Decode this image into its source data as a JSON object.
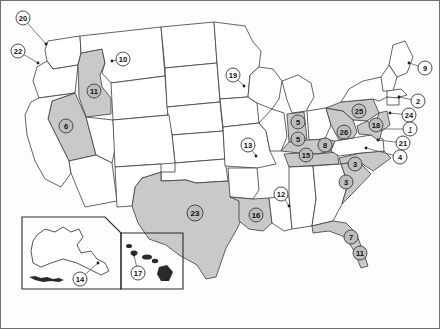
{
  "figure": {
    "type": "choropleth-point-map",
    "region": "United States",
    "background_color": "#fdfdfd",
    "border_color": "#6f6f6f",
    "shaded_state_color": "#c9c9c9",
    "plain_state_color": "#ffffff",
    "outline_color": "#3b3b3b",
    "marker_fill": "#ffffff",
    "marker_border": "#4a4a4a",
    "has_alaska_inset": true,
    "has_hawaii_inset": true
  },
  "insets": [
    {
      "name": "alaska-inset",
      "label": "14"
    },
    {
      "name": "hawaii-inset",
      "label": "17"
    }
  ],
  "markers": [
    {
      "id": "marker-20",
      "label": "20",
      "x": 22,
      "y": 17,
      "size": "m-sm",
      "on_shade": false,
      "italic": false,
      "leader": true,
      "dot_x": 45,
      "dot_y": 43
    },
    {
      "id": "marker-22",
      "label": "22",
      "x": 17,
      "y": 50,
      "size": "m-sm",
      "on_shade": false,
      "italic": false,
      "leader": true,
      "dot_x": 37,
      "dot_y": 62
    },
    {
      "id": "marker-10",
      "label": "10",
      "x": 122,
      "y": 58,
      "size": "m-sm",
      "on_shade": false,
      "italic": false,
      "leader": true,
      "dot_x": 111,
      "dot_y": 60
    },
    {
      "id": "marker-11-idaho",
      "label": "11",
      "x": 93,
      "y": 90,
      "size": "m-sm",
      "on_shade": true,
      "italic": false,
      "leader": false,
      "dot_x": 0,
      "dot_y": 0
    },
    {
      "id": "marker-6",
      "label": "6",
      "x": 65,
      "y": 125,
      "size": "m-sm",
      "on_shade": true,
      "italic": false,
      "leader": false,
      "dot_x": 0,
      "dot_y": 0
    },
    {
      "id": "marker-19",
      "label": "19",
      "x": 232,
      "y": 74,
      "size": "m-sm",
      "on_shade": false,
      "italic": false,
      "leader": true,
      "dot_x": 243,
      "dot_y": 85
    },
    {
      "id": "marker-13",
      "label": "13",
      "x": 247,
      "y": 144,
      "size": "m-sm",
      "on_shade": false,
      "italic": false,
      "leader": true,
      "dot_x": 255,
      "dot_y": 155
    },
    {
      "id": "marker-9",
      "label": "9",
      "x": 424,
      "y": 67,
      "size": "m-sm",
      "on_shade": false,
      "italic": false,
      "leader": true,
      "dot_x": 408,
      "dot_y": 62
    },
    {
      "id": "marker-2",
      "label": "2",
      "x": 417,
      "y": 100,
      "size": "m-sm",
      "on_shade": false,
      "italic": false,
      "leader": true,
      "dot_x": 398,
      "dot_y": 96
    },
    {
      "id": "marker-24",
      "label": "24",
      "x": 408,
      "y": 114,
      "size": "m-sm",
      "on_shade": false,
      "italic": false,
      "leader": true,
      "dot_x": 389,
      "dot_y": 112
    },
    {
      "id": "marker-1",
      "label": "1",
      "x": 409,
      "y": 128,
      "size": "m-sm",
      "on_shade": false,
      "italic": true,
      "leader": true,
      "dot_x": 378,
      "dot_y": 128
    },
    {
      "id": "marker-21",
      "label": "21",
      "x": 402,
      "y": 142,
      "size": "m-sm",
      "on_shade": false,
      "italic": false,
      "leader": true,
      "dot_x": 377,
      "dot_y": 139
    },
    {
      "id": "marker-4",
      "label": "4",
      "x": 399,
      "y": 156,
      "size": "m-sm",
      "on_shade": false,
      "italic": false,
      "leader": true,
      "dot_x": 365,
      "dot_y": 147
    },
    {
      "id": "marker-25",
      "label": "25",
      "x": 358,
      "y": 110,
      "size": "m-sm",
      "on_shade": true,
      "italic": false,
      "leader": false,
      "dot_x": 0,
      "dot_y": 0
    },
    {
      "id": "marker-18",
      "label": "18",
      "x": 375,
      "y": 124,
      "size": "m-sm",
      "on_shade": true,
      "italic": false,
      "leader": false,
      "dot_x": 0,
      "dot_y": 0
    },
    {
      "id": "marker-26",
      "label": "26",
      "x": 343,
      "y": 131,
      "size": "m-sm",
      "on_shade": true,
      "italic": false,
      "leader": false,
      "dot_x": 0,
      "dot_y": 0
    },
    {
      "id": "marker-5-indiana",
      "label": "5",
      "x": 297,
      "y": 121,
      "size": "m-sm",
      "on_shade": true,
      "italic": false,
      "leader": false,
      "dot_x": 0,
      "dot_y": 0
    },
    {
      "id": "marker-5-kentucky",
      "label": "5",
      "x": 297,
      "y": 138,
      "size": "m-sm",
      "on_shade": true,
      "italic": false,
      "leader": false,
      "dot_x": 0,
      "dot_y": 0
    },
    {
      "id": "marker-15",
      "label": "15",
      "x": 305,
      "y": 154,
      "size": "m-sm",
      "on_shade": true,
      "italic": false,
      "leader": false,
      "dot_x": 0,
      "dot_y": 0
    },
    {
      "id": "marker-8",
      "label": "8",
      "x": 324,
      "y": 144,
      "size": "m-sm",
      "on_shade": true,
      "italic": false,
      "leader": false,
      "dot_x": 0,
      "dot_y": 0
    },
    {
      "id": "marker-3-nc",
      "label": "3",
      "x": 354,
      "y": 163,
      "size": "m-sm",
      "on_shade": true,
      "italic": false,
      "leader": false,
      "dot_x": 0,
      "dot_y": 0
    },
    {
      "id": "marker-3-sc",
      "label": "3",
      "x": 345,
      "y": 181,
      "size": "m-sm",
      "on_shade": true,
      "italic": false,
      "leader": false,
      "dot_x": 0,
      "dot_y": 0
    },
    {
      "id": "marker-12",
      "label": "12",
      "x": 280,
      "y": 193,
      "size": "m-sm",
      "on_shade": false,
      "italic": false,
      "leader": true,
      "dot_x": 288,
      "dot_y": 205
    },
    {
      "id": "marker-23",
      "label": "23",
      "x": 194,
      "y": 212,
      "size": "m-md",
      "on_shade": true,
      "italic": false,
      "leader": false,
      "dot_x": 0,
      "dot_y": 0
    },
    {
      "id": "marker-16",
      "label": "16",
      "x": 255,
      "y": 214,
      "size": "m-sm",
      "on_shade": true,
      "italic": false,
      "leader": false,
      "dot_x": 0,
      "dot_y": 0
    },
    {
      "id": "marker-7",
      "label": "7",
      "x": 350,
      "y": 236,
      "size": "m-sm",
      "on_shade": true,
      "italic": false,
      "leader": false,
      "dot_x": 0,
      "dot_y": 0
    },
    {
      "id": "marker-11-florida",
      "label": "11",
      "x": 359,
      "y": 252,
      "size": "m-sm",
      "on_shade": true,
      "italic": false,
      "leader": false,
      "dot_x": 0,
      "dot_y": 0
    },
    {
      "id": "marker-14",
      "label": "14",
      "x": 79,
      "y": 278,
      "size": "m-sm",
      "on_shade": false,
      "italic": false,
      "leader": true,
      "dot_x": 97,
      "dot_y": 262
    },
    {
      "id": "marker-17",
      "label": "17",
      "x": 137,
      "y": 272,
      "size": "m-sm",
      "on_shade": false,
      "italic": false,
      "leader": true,
      "dot_x": 133,
      "dot_y": 254
    }
  ]
}
